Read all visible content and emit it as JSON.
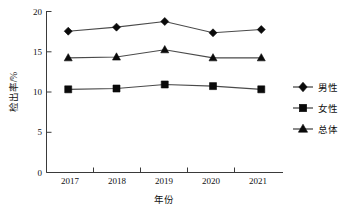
{
  "chart_data": {
    "type": "line",
    "title": "",
    "subtitle": "",
    "xlabel": "年份",
    "ylabel": "检出率/%",
    "categories": [
      "2017",
      "2018",
      "2019",
      "2020",
      "2021"
    ],
    "x": [
      2017,
      2018,
      2019,
      2020,
      2021
    ],
    "xlim": [
      2016.55,
      2021.45
    ],
    "ylim": [
      0,
      20
    ],
    "yticks": [
      0,
      5,
      10,
      15,
      20
    ],
    "ytick_labels": [
      "0",
      "5",
      "10",
      "15",
      "20"
    ],
    "xtick_labels": [
      "2017",
      "2018",
      "2019",
      "2020",
      "2021"
    ],
    "grid": false,
    "legend_position": "right",
    "series": [
      {
        "name": "男性",
        "marker": "diamond",
        "color": "#0a0a0a",
        "values": [
          17.5,
          18.0,
          18.7,
          17.3,
          17.7
        ]
      },
      {
        "name": "女性",
        "marker": "square",
        "color": "#0a0a0a",
        "values": [
          10.3,
          10.4,
          10.9,
          10.7,
          10.3
        ]
      },
      {
        "name": "总体",
        "marker": "triangle",
        "color": "#0a0a0a",
        "values": [
          14.2,
          14.3,
          15.2,
          14.2,
          14.2
        ]
      }
    ]
  },
  "legend": {
    "items": [
      {
        "label": "男性",
        "marker": "diamond-marker-icon"
      },
      {
        "label": "女性",
        "marker": "square-marker-icon"
      },
      {
        "label": "总体",
        "marker": "triangle-marker-icon"
      }
    ]
  },
  "axes": {
    "y_title": "检出率/%",
    "x_title": "年份"
  }
}
